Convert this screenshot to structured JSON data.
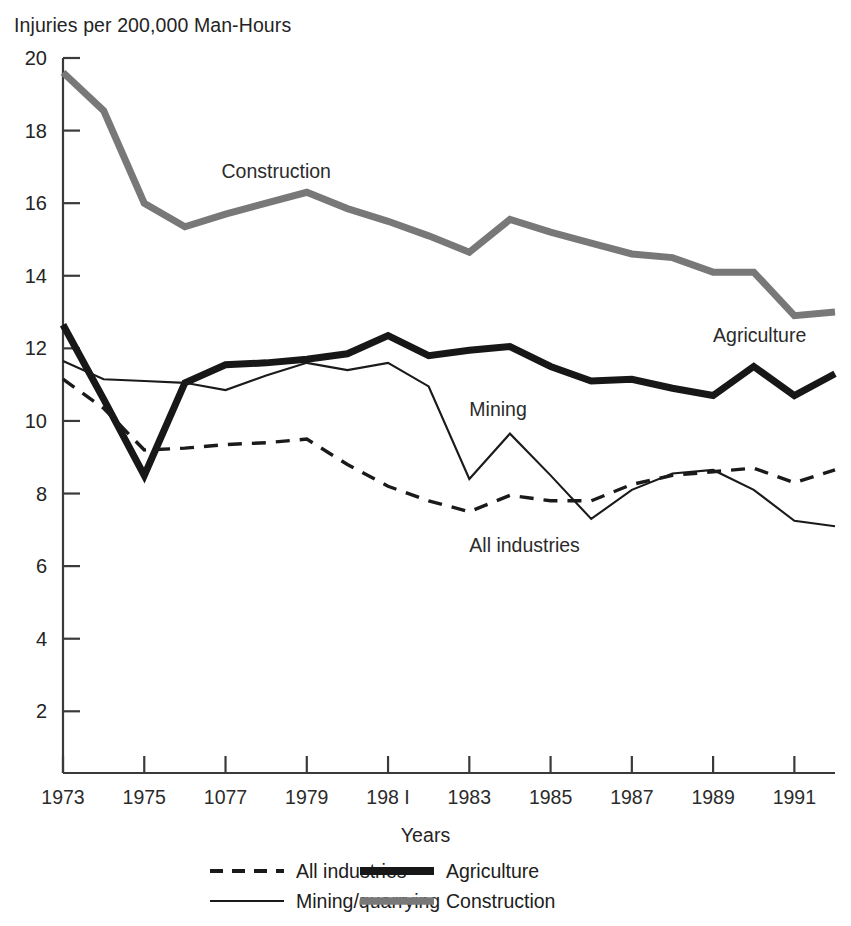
{
  "chart_data": {
    "type": "line",
    "title": "",
    "ylabel": "Injuries per 200,000 Man-Hours",
    "xlabel": "Years",
    "xlim": [
      1973,
      1992
    ],
    "ylim": [
      0,
      20
    ],
    "yticks": [
      2,
      4,
      6,
      8,
      10,
      12,
      14,
      16,
      18,
      20
    ],
    "ytick_labels": [
      "2",
      "4",
      "6",
      "8",
      "10",
      "12",
      "14",
      "16",
      "18",
      "20"
    ],
    "xticks": [
      1973,
      1975,
      1977,
      1979,
      1981,
      1983,
      1985,
      1987,
      1989,
      1991
    ],
    "xtick_labels": [
      "1973",
      "1975",
      "1077",
      "1979",
      "198 I",
      "1983",
      "1985",
      "1987",
      "1989",
      "1991"
    ],
    "grid": false,
    "legend_position": "below",
    "x": [
      1973,
      1974,
      1975,
      1976,
      1977,
      1978,
      1979,
      1980,
      1981,
      1982,
      1983,
      1984,
      1985,
      1986,
      1987,
      1988,
      1989,
      1990,
      1991,
      1992
    ],
    "series": [
      {
        "name": "All industries",
        "style": "dashed",
        "color": "#1a1a1a",
        "width": 3.4,
        "values": [
          11.15,
          10.35,
          9.2,
          9.25,
          9.35,
          9.4,
          9.5,
          8.8,
          8.2,
          7.8,
          7.5,
          7.95,
          7.8,
          7.8,
          8.25,
          8.5,
          8.6,
          8.7,
          8.3,
          8.65
        ]
      },
      {
        "name": "Mining/quarrying",
        "style": "solid",
        "color": "#1a1a1a",
        "width": 2.1,
        "values": [
          11.65,
          11.15,
          11.1,
          11.05,
          10.85,
          11.25,
          11.6,
          11.4,
          11.6,
          10.95,
          8.4,
          9.65,
          8.5,
          7.3,
          8.1,
          8.55,
          8.65,
          8.1,
          7.25,
          7.1
        ]
      },
      {
        "name": "Agriculture",
        "style": "solid",
        "color": "#171717",
        "width": 7.0,
        "values": [
          12.65,
          10.6,
          8.5,
          11.05,
          11.55,
          11.6,
          11.7,
          11.85,
          12.35,
          11.8,
          11.95,
          12.05,
          11.5,
          11.1,
          11.15,
          10.9,
          10.7,
          11.5,
          10.7,
          11.3
        ]
      },
      {
        "name": "Construction",
        "style": "solid",
        "color": "#787878",
        "width": 7.0,
        "values": [
          19.6,
          18.55,
          16.0,
          15.35,
          15.7,
          16.0,
          16.3,
          15.85,
          15.5,
          15.1,
          14.65,
          15.55,
          15.2,
          14.9,
          14.6,
          14.5,
          14.1,
          14.1,
          12.9,
          13.0
        ]
      }
    ],
    "inline_labels": [
      {
        "text": "Construction",
        "x": 1976.9,
        "y": 16.85
      },
      {
        "text": "Agriculture",
        "x": 1989.0,
        "y": 12.35
      },
      {
        "text": "Mining",
        "x": 1983.0,
        "y": 10.3
      },
      {
        "text": "All industries",
        "x": 1983.0,
        "y": 6.55
      }
    ]
  },
  "legend": {
    "entries": [
      {
        "label": "All industries",
        "swatch": "dashed-line-swatch"
      },
      {
        "label": "Agriculture",
        "swatch": "thick-black-line-swatch"
      },
      {
        "label": "Mining/quarrying",
        "swatch": "thin-black-line-swatch"
      },
      {
        "label": "Construction",
        "swatch": "thick-gray-line-swatch"
      }
    ]
  }
}
